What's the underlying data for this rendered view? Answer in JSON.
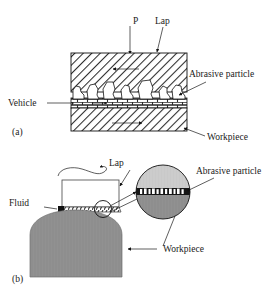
{
  "figure": {
    "panels": [
      {
        "tag": "(a)",
        "name": "flat-lapping-schematic"
      },
      {
        "tag": "(b)",
        "name": "curved-lapping-schematic"
      }
    ]
  },
  "panel_a": {
    "tag": "(a)",
    "labels": {
      "pressure": "P",
      "lap": "Lap",
      "abrasive_particle": "Abrasive particle",
      "vehicle": "Vehicle",
      "workpiece": "Workpiece"
    }
  },
  "panel_b": {
    "tag": "(b)",
    "labels": {
      "lap": "Lap",
      "abrasive_particle": "Abrasive particle",
      "fluid": "Fluid",
      "workpiece": "Workpiece"
    }
  },
  "colors": {
    "ink": "#1a1a1a",
    "hatch_line": "#2b2b2b",
    "lap_fill_light": "#c9c9c9",
    "workpiece_fill_dark": "#8e8e8e",
    "particle_band": "#161616",
    "particle_white": "#ffffff",
    "paper": "#ffffff"
  }
}
